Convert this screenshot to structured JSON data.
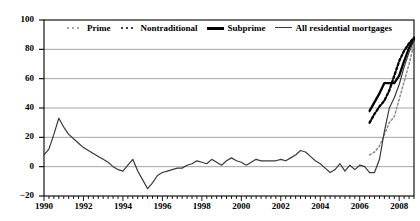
{
  "chart_data": {
    "type": "line",
    "title": "",
    "xlabel": "",
    "ylabel": "",
    "xlim": [
      1990,
      2008.75
    ],
    "ylim": [
      -20,
      100
    ],
    "yticks": [
      -20,
      0,
      20,
      40,
      60,
      80,
      100
    ],
    "ytick_labels": [
      "−20",
      "0",
      "20",
      "40",
      "60",
      "80",
      "100"
    ],
    "xticks": [
      1990,
      1992,
      1994,
      1996,
      1998,
      2000,
      2002,
      2004,
      2006,
      2008
    ],
    "xtick_labels": [
      "1990",
      "1992",
      "1994",
      "1996",
      "1998",
      "2000",
      "2002",
      "2004",
      "2006",
      "2008"
    ],
    "grid": "horizontal",
    "legend_position": "top-inside",
    "series": [
      {
        "name": "Prime",
        "key_style": "dotted-light",
        "color": "#8a8a8a",
        "x": [
          2006.5,
          2006.75,
          2007.0,
          2007.25,
          2007.5,
          2007.75,
          2008.0,
          2008.25,
          2008.5,
          2008.75
        ],
        "values": [
          8,
          10,
          14,
          22,
          30,
          34,
          46,
          58,
          70,
          84
        ]
      },
      {
        "name": "Nontraditional",
        "key_style": "dotted-bold",
        "color": "#000000",
        "x": [
          2006.5,
          2006.75,
          2007.0,
          2007.25,
          2007.5,
          2007.75,
          2008.0,
          2008.25,
          2008.5,
          2008.75
        ],
        "values": [
          30,
          36,
          41,
          45,
          52,
          62,
          72,
          79,
          84,
          88
        ]
      },
      {
        "name": "Subprime",
        "key_style": "solid-bold",
        "color": "#000000",
        "x": [
          2006.5,
          2006.75,
          2007.0,
          2007.25,
          2007.5,
          2007.75,
          2008.0,
          2008.25,
          2008.5,
          2008.75
        ],
        "values": [
          38,
          44,
          50,
          57,
          57,
          57,
          62,
          72,
          81,
          87
        ]
      },
      {
        "name": "All residential mortgages",
        "key_style": "solid",
        "color": "#3a3a3a",
        "x": [
          1990.0,
          1990.25,
          1990.5,
          1990.75,
          1991.0,
          1991.25,
          1991.5,
          1991.75,
          1992.0,
          1992.25,
          1992.5,
          1992.75,
          1993.0,
          1993.25,
          1993.5,
          1993.75,
          1994.0,
          1994.25,
          1994.5,
          1994.75,
          1995.0,
          1995.25,
          1995.5,
          1995.75,
          1996.0,
          1996.25,
          1996.5,
          1996.75,
          1997.0,
          1997.25,
          1997.5,
          1997.75,
          1998.0,
          1998.25,
          1998.5,
          1998.75,
          1999.0,
          1999.25,
          1999.5,
          1999.75,
          2000.0,
          2000.25,
          2000.5,
          2000.75,
          2001.0,
          2001.25,
          2001.5,
          2001.75,
          2002.0,
          2002.25,
          2002.5,
          2002.75,
          2003.0,
          2003.25,
          2003.5,
          2003.75,
          2004.0,
          2004.25,
          2004.5,
          2004.75,
          2005.0,
          2005.25,
          2005.5,
          2005.75,
          2006.0,
          2006.25,
          2006.5,
          2006.75,
          2007.0,
          2007.25,
          2007.5,
          2007.75,
          2008.0,
          2008.25,
          2008.5,
          2008.75
        ],
        "values": [
          8,
          12,
          22,
          33,
          27,
          22,
          19,
          16,
          13,
          11,
          9,
          7,
          5,
          3,
          0,
          -2,
          -3,
          1,
          5,
          -3,
          -9,
          -15,
          -11,
          -6,
          -4,
          -3,
          -2,
          -1,
          -1,
          1,
          2,
          4,
          3,
          2,
          5,
          3,
          1,
          4,
          6,
          4,
          3,
          1,
          3,
          5,
          4,
          4,
          4,
          4,
          5,
          4,
          6,
          8,
          11,
          10,
          7,
          4,
          2,
          -1,
          -4,
          -2,
          2,
          -3,
          1,
          -2,
          1,
          0,
          -4,
          -4,
          5,
          24,
          40,
          47,
          56,
          68,
          78,
          86
        ]
      }
    ]
  },
  "legend": {
    "items": [
      {
        "label": "Prime"
      },
      {
        "label": "Nontraditional"
      },
      {
        "label": "Subprime"
      },
      {
        "label": "All residential mortgages"
      }
    ]
  }
}
